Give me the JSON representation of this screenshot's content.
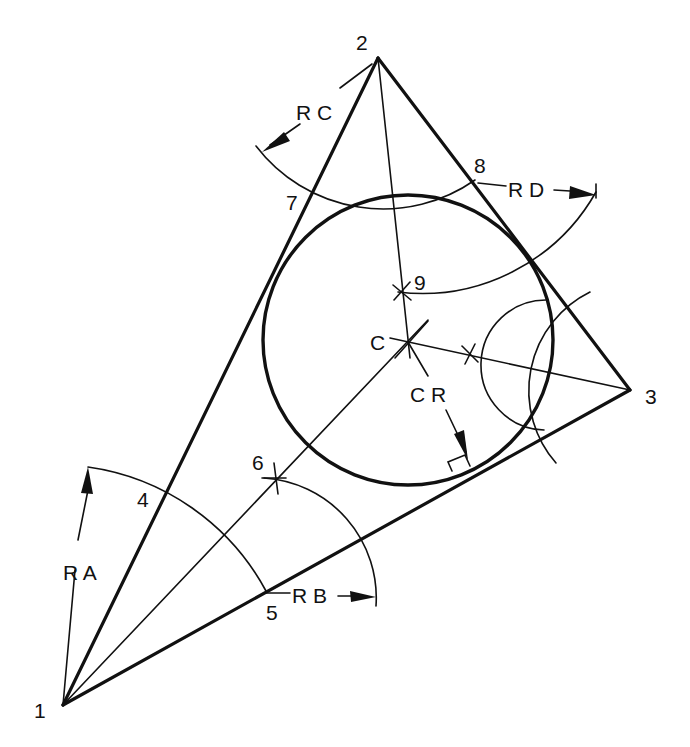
{
  "diagram": {
    "vertices": [
      {
        "id": "1",
        "label": "1",
        "x": 63,
        "y": 705
      },
      {
        "id": "2",
        "label": "2",
        "x": 378,
        "y": 58
      },
      {
        "id": "3",
        "label": "3",
        "x": 630,
        "y": 390
      }
    ],
    "points": [
      {
        "id": "4",
        "label": "4"
      },
      {
        "id": "5",
        "label": "5"
      },
      {
        "id": "6",
        "label": "6"
      },
      {
        "id": "7",
        "label": "7"
      },
      {
        "id": "8",
        "label": "8"
      },
      {
        "id": "9",
        "label": "9"
      }
    ],
    "center": {
      "label": "C",
      "x": 408,
      "y": 342
    },
    "radii": {
      "ra": "R A",
      "rb": "R B",
      "rc": "R C",
      "rd": "R D",
      "cr": "C R"
    },
    "inscribed_circle": {
      "cx": 408,
      "cy": 340,
      "r": 145
    }
  }
}
